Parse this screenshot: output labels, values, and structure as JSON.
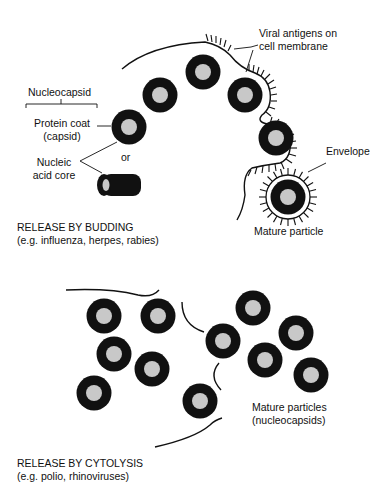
{
  "budding": {
    "labels": {
      "viral_antigens_line1": "Viral antigens on",
      "viral_antigens_line2": "cell membrane",
      "nucleocapsid": "Nucleocapsid",
      "protein_coat_line1": "Protein coat",
      "protein_coat_line2": "(capsid)",
      "or": "or",
      "nucleic_line1": "Nucleic",
      "nucleic_line2": "acid core",
      "envelope": "Envelope",
      "mature_particle": "Mature particle"
    },
    "title": "RELEASE BY BUDDING",
    "examples": "(e.g. influenza, herpes, rabies)"
  },
  "cytolysis": {
    "labels": {
      "mature_particles_line1": "Mature particles",
      "mature_particles_line2": "(nucleocapsids)"
    },
    "title": "RELEASE BY CYTOLYSIS",
    "examples": "(e.g. polio, rhinoviruses)"
  },
  "colors": {
    "capsid": "#111111",
    "core": "#c8c8c8",
    "line": "#111111"
  }
}
